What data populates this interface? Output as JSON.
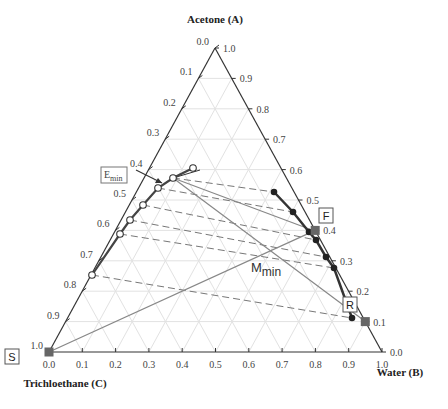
{
  "chart_data": {
    "type": "ternary",
    "title": "",
    "axes": {
      "top": "Acetone (A)",
      "right": "Water (B)",
      "left": "Trichloethane (C)"
    },
    "ticks": [
      "0.0",
      "0.1",
      "0.2",
      "0.3",
      "0.4",
      "0.5",
      "0.6",
      "0.7",
      "0.8",
      "0.9",
      "1.0"
    ],
    "labels": {
      "F": "F",
      "R": "R",
      "S": "S",
      "E_min": "E",
      "E_min_sub": "min",
      "M_min": "M",
      "M_min_sub": "min"
    },
    "extract_curve_px": [
      [
        193,
        168
      ],
      [
        173,
        178
      ],
      [
        158,
        188
      ],
      [
        143,
        205
      ],
      [
        130,
        220
      ],
      [
        120,
        234
      ],
      [
        92,
        275
      ]
    ],
    "raffinate_curve_px": [
      [
        274,
        192
      ],
      [
        293,
        212
      ],
      [
        309,
        232
      ],
      [
        316,
        240
      ],
      [
        326,
        257
      ],
      [
        334,
        268
      ],
      [
        352,
        318
      ]
    ],
    "points": {
      "F": {
        "A": 0.4,
        "B": 0.6,
        "C": 0.0
      },
      "R": {
        "A": 0.1,
        "B": 0.9,
        "C": 0.0
      },
      "S": {
        "A": 0.0,
        "B": 0.0,
        "C": 1.0
      }
    },
    "grid": true
  }
}
